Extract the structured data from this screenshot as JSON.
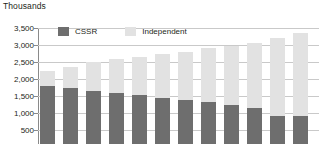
{
  "chart_data": {
    "type": "bar",
    "stacked": true,
    "title": "",
    "unit_label": "Thousands",
    "xlabel": "",
    "ylabel": "",
    "ylim": [
      0,
      3500
    ],
    "ytick_values": [
      3500,
      3000,
      2500,
      2000,
      1500,
      1000,
      500
    ],
    "ytick_labels": [
      "3,500",
      "3,000",
      "2,500",
      "2,000",
      "1,500",
      "1,000",
      "500"
    ],
    "grid": true,
    "legend_position": "top-left-inside",
    "categories": [
      "1",
      "2",
      "3",
      "4",
      "5",
      "6",
      "7",
      "8",
      "9",
      "10",
      "11",
      "12"
    ],
    "series": [
      {
        "name": "CSSR",
        "color": "#6e6e6e",
        "values": [
          1800,
          1730,
          1640,
          1580,
          1520,
          1440,
          1380,
          1310,
          1230,
          1150,
          900,
          900
        ]
      },
      {
        "name": "Independent",
        "color": "#e2e2e2",
        "values": [
          450,
          620,
          860,
          1000,
          1130,
          1290,
          1420,
          1590,
          1740,
          1910,
          2300,
          2450
        ]
      }
    ],
    "totals": [
      2250,
      2350,
      2500,
      2580,
      2650,
      2730,
      2800,
      2900,
      2970,
      3060,
      3200,
      3350
    ]
  },
  "legend": {
    "entries": [
      {
        "label": "CSSR",
        "swatch": "cssr-swatch"
      },
      {
        "label": "Independent",
        "swatch": "independent-swatch"
      }
    ]
  },
  "colors": {
    "cssr": "#6e6e6e",
    "independent": "#e2e2e2",
    "gridline": "#c9c9c9",
    "axis": "#8a8a8a",
    "text": "#231f20",
    "background": "#ffffff"
  }
}
